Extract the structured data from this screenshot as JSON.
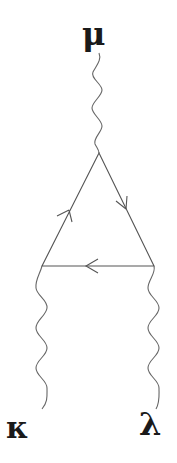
{
  "diagram": {
    "type": "feynman-triangle",
    "labels": {
      "top": "μ",
      "bottom_left": "κ",
      "bottom_right": "λ"
    },
    "vertices": {
      "top": [
        99,
        153
      ],
      "bottom_left": [
        42,
        266
      ],
      "bottom_right": [
        154,
        266
      ]
    },
    "edges": [
      {
        "from": "bottom_left",
        "to": "top",
        "kind": "fermion",
        "arrow": "toward top"
      },
      {
        "from": "top",
        "to": "bottom_right",
        "kind": "fermion",
        "arrow": "toward bottom_right"
      },
      {
        "from": "bottom_right",
        "to": "bottom_left",
        "kind": "fermion",
        "arrow": "toward bottom_left"
      }
    ],
    "external_lines": [
      {
        "label": "μ",
        "kind": "photon (wavy)",
        "attached_to": "top"
      },
      {
        "label": "κ",
        "kind": "photon (wavy)",
        "attached_to": "bottom_left"
      },
      {
        "label": "λ",
        "kind": "photon (wavy)",
        "attached_to": "bottom_right"
      }
    ],
    "colors": {
      "line": "#555555",
      "label": "#1a1a1a",
      "background": "#ffffff"
    }
  }
}
